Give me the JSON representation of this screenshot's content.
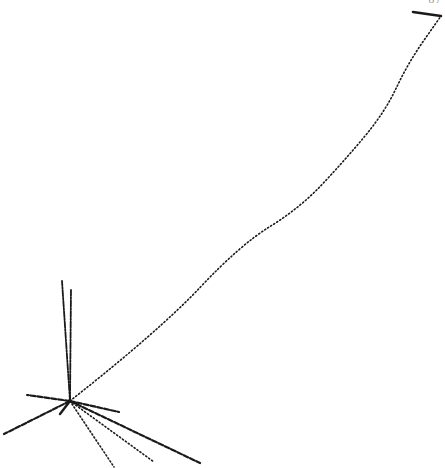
{
  "figure": {
    "corner_label": "87",
    "colors": {
      "ink": "#1a1a1a",
      "background": "#ffffff",
      "faint_label": "#9a9a9a"
    },
    "vertex": {
      "x": 70,
      "y": 401
    },
    "long_track": {
      "points": [
        [
          70,
          401
        ],
        [
          160,
          330
        ],
        [
          240,
          245
        ],
        [
          300,
          208
        ],
        [
          345,
          160
        ],
        [
          385,
          112
        ],
        [
          408,
          63
        ],
        [
          441,
          16
        ]
      ],
      "style": "dotted"
    },
    "arrow": {
      "from": [
        413,
        12
      ],
      "to": [
        441,
        16
      ]
    },
    "tracks": [
      {
        "name": "vertical-track-left",
        "from": [
          70,
          401
        ],
        "to": [
          62,
          281
        ],
        "style": "dash-dot"
      },
      {
        "name": "vertical-track-right",
        "from": [
          70,
          401
        ],
        "to": [
          71,
          289
        ],
        "style": "dash-dot"
      },
      {
        "name": "left-upper-track",
        "from": [
          70,
          401
        ],
        "to": [
          27,
          395
        ],
        "style": "dash"
      },
      {
        "name": "left-lower-track",
        "from": [
          70,
          401
        ],
        "to": [
          4,
          434
        ],
        "style": "dash"
      },
      {
        "name": "short-stub-track",
        "from": [
          70,
          401
        ],
        "to": [
          60,
          414
        ],
        "style": "solid"
      },
      {
        "name": "right-short-track",
        "from": [
          70,
          401
        ],
        "to": [
          119,
          412
        ],
        "style": "dash"
      },
      {
        "name": "down-steep-track",
        "from": [
          70,
          401
        ],
        "to": [
          114,
          467
        ],
        "style": "dotted"
      },
      {
        "name": "down-mid-track",
        "from": [
          70,
          401
        ],
        "to": [
          154,
          462
        ],
        "style": "dotted"
      },
      {
        "name": "down-long-track",
        "from": [
          70,
          401
        ],
        "to": [
          200,
          463
        ],
        "style": "dash"
      }
    ]
  }
}
